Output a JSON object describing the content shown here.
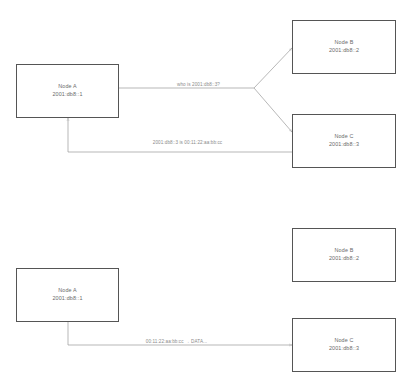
{
  "diagram": {
    "colors": {
      "box_border": "#555555",
      "wire": "#9a9a9a",
      "node_text": "#6a6a6a",
      "label_text": "#8a8a8a",
      "background": "#ffffff"
    },
    "panels": [
      {
        "id": "neighbor-discovery",
        "nodes": [
          {
            "id": "a",
            "name": "Node A",
            "address": "2001:db8::1"
          },
          {
            "id": "b",
            "name": "Node B",
            "address": "2001:db8::2"
          },
          {
            "id": "c",
            "name": "Node C",
            "address": "2001:db8::3"
          }
        ],
        "edges": [
          {
            "id": "solicitation",
            "label": "who is 2001:db8::3?",
            "from": "a",
            "to": "b,c"
          },
          {
            "id": "advertisement",
            "label": "2001:db8::3 is 00:11:22:aa:bb:cc",
            "from": "c",
            "to": "a"
          }
        ]
      },
      {
        "id": "data-transfer",
        "nodes": [
          {
            "id": "a",
            "name": "Node A",
            "address": "2001:db8::1"
          },
          {
            "id": "b",
            "name": "Node B",
            "address": "2001:db8::2"
          },
          {
            "id": "c",
            "name": "Node C",
            "address": "2001:db8::3"
          }
        ],
        "edges": [
          {
            "id": "data",
            "label": "00:11:22:aa:bb:cc → DATA...",
            "from": "a",
            "to": "c"
          }
        ]
      }
    ]
  }
}
